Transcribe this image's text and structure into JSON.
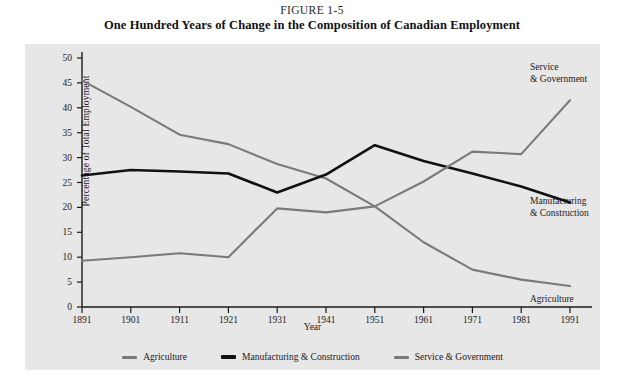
{
  "figure": {
    "number": "FIGURE 1-5",
    "title": "One Hundred Years of Change in the Composition of Canadian Employment"
  },
  "colors": {
    "panel_background": "#e7e7e7",
    "page_background": "#ffffff",
    "axis": "#1a1a1a",
    "agriculture": "#7a7a7a",
    "manufacturing": "#111111",
    "service": "#7a7a7a"
  },
  "chart_data": {
    "type": "line",
    "title": "One Hundred Years of Change in the Composition of Canadian Employment",
    "xlabel": "Year",
    "ylabel": "Percentage of Total Employment",
    "categories": [
      "1891",
      "1901",
      "1911",
      "1921",
      "1931",
      "1941",
      "1951",
      "1961",
      "1971",
      "1981",
      "1991"
    ],
    "x": [
      1891,
      1901,
      1911,
      1921,
      1931,
      1941,
      1951,
      1961,
      1971,
      1981,
      1991
    ],
    "xlim": [
      1891,
      1991
    ],
    "ylim": [
      0,
      50
    ],
    "yticks": [
      0,
      5,
      10,
      15,
      20,
      25,
      30,
      35,
      40,
      45,
      50
    ],
    "grid": false,
    "legend_position": "bottom",
    "series": [
      {
        "name": "Agriculture",
        "color": "#7a7a7a",
        "values": [
          45.5,
          40.2,
          34.6,
          32.7,
          28.7,
          25.8,
          20.2,
          13.0,
          7.5,
          5.5,
          4.2
        ]
      },
      {
        "name": "Manufacturing & Construction",
        "color": "#111111",
        "values": [
          26.4,
          27.5,
          27.2,
          26.8,
          23.0,
          26.6,
          32.5,
          29.3,
          26.8,
          24.2,
          21.0
        ]
      },
      {
        "name": "Service & Government",
        "color": "#7a7a7a",
        "values": [
          9.3,
          10.0,
          10.8,
          10.0,
          19.8,
          19.0,
          20.2,
          25.2,
          31.2,
          30.7,
          41.5
        ]
      }
    ],
    "annotations": [
      {
        "text": "Service\n& Government",
        "series": "Service & Government"
      },
      {
        "text": "Manufacturing\n& Construction",
        "series": "Manufacturing & Construction"
      },
      {
        "text": "Agriculture",
        "series": "Agriculture"
      }
    ]
  },
  "legend": {
    "items": [
      {
        "label": "Agriculture",
        "color": "#7a7a7a",
        "weight": "thin"
      },
      {
        "label": "Manufacturing & Construction",
        "color": "#111111",
        "weight": "thick"
      },
      {
        "label": "Service & Government",
        "color": "#7a7a7a",
        "weight": "thin"
      }
    ]
  }
}
